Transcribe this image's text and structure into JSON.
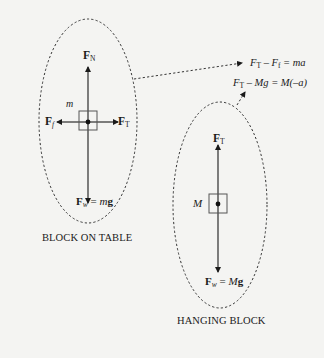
{
  "diagram": {
    "type": "free-body-diagram",
    "colors": {
      "ink": "#1a1a1a",
      "background": "#f4f4f2",
      "box": "#555555"
    },
    "block_on_table": {
      "caption": "BLOCK ON TABLE",
      "mass_label": "m",
      "forces": {
        "normal": {
          "symbol": "F",
          "sub": "N",
          "direction": "up"
        },
        "friction": {
          "symbol": "F",
          "sub": "f",
          "direction": "left"
        },
        "tension": {
          "symbol": "F",
          "sub": "T",
          "direction": "right"
        },
        "weight": {
          "symbol": "F",
          "sub": "w",
          "eq": " = ",
          "mass": "m",
          "g": "g",
          "direction": "down"
        }
      }
    },
    "hanging_block": {
      "caption": "HANGING BLOCK",
      "mass_label": "M",
      "forces": {
        "tension": {
          "symbol": "F",
          "sub": "T",
          "direction": "up"
        },
        "weight": {
          "symbol": "F",
          "sub": "w",
          "eq": " = ",
          "mass": "M",
          "g": "g",
          "direction": "down"
        }
      }
    },
    "equations": [
      {
        "a": "F",
        "a_sub": "T",
        "op": " – ",
        "b": "F",
        "b_sub": "f",
        "rhs": " = ma"
      },
      {
        "a": "F",
        "a_sub": "T",
        "op": " – ",
        "b": "Mg",
        "b_sub": "",
        "rhs": " = M(–a)"
      }
    ]
  }
}
